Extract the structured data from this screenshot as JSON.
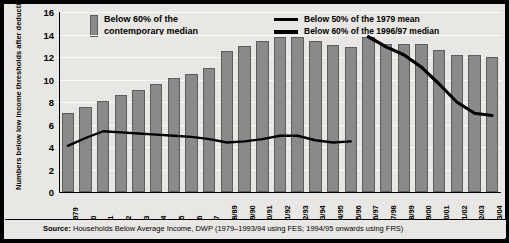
{
  "legend": {
    "bar_label_line1": "Below 60% of the",
    "bar_label_line2": "contemporary median",
    "line1_label": "Below 50% of the 1979 mean",
    "line2_label": "Below 60% of the 1996/97 median",
    "bar_color": "#8a8a8a",
    "line_color": "#000000"
  },
  "axis": {
    "ytitle": "Numbers below low income thresholds after deducting housing costs (millions)"
  },
  "footer": {
    "source_prefix": "Source:",
    "source_text": " Households Below Average Income, DWP (1979–1993/94 using FES; 1994/95 onwards using FRS)"
  },
  "chart_data": {
    "type": "bar",
    "title": "",
    "xlabel": "",
    "ylabel": "Numbers below low income thresholds after deducting housing costs (millions)",
    "ylim": [
      0,
      16
    ],
    "yticks": [
      0,
      2,
      4,
      6,
      8,
      10,
      12,
      14,
      16
    ],
    "grid": true,
    "legend_position": "top",
    "categories": [
      "1979",
      "80",
      "81",
      "82",
      "83",
      "84",
      "85",
      "86",
      "87",
      "88/89",
      "89/90",
      "90/91",
      "91/92",
      "92/93",
      "93/94",
      "94/95",
      "95/96",
      "96/97",
      "97/98",
      "98/99",
      "99/00",
      "00/01",
      "01/02",
      "02/03",
      "03/04"
    ],
    "series": [
      {
        "name": "Below 60% of the contemporary median",
        "type": "bar",
        "values": [
          7.0,
          7.6,
          8.1,
          8.6,
          9.1,
          9.6,
          10.1,
          10.5,
          11.0,
          12.5,
          13.0,
          13.4,
          13.8,
          13.8,
          13.4,
          13.1,
          12.9,
          13.8,
          13.2,
          13.2,
          13.2,
          12.6,
          12.2,
          12.2,
          12.0
        ]
      },
      {
        "name": "Below 50% of the 1979 mean",
        "type": "line",
        "x": [
          "1979",
          "80",
          "81",
          "82",
          "83",
          "84",
          "85",
          "86",
          "87",
          "88/89",
          "89/90",
          "90/91",
          "91/92",
          "92/93",
          "93/94",
          "94/95",
          "95/96"
        ],
        "values": [
          4.1,
          4.8,
          5.4,
          5.3,
          5.2,
          5.1,
          5.0,
          4.9,
          4.7,
          4.4,
          4.5,
          4.7,
          5.0,
          5.0,
          4.6,
          4.4,
          4.5
        ]
      },
      {
        "name": "Below 60% of the 1996/97 median",
        "type": "line",
        "x": [
          "96/97",
          "97/98",
          "98/99",
          "99/00",
          "00/01",
          "01/02",
          "02/03",
          "03/04"
        ],
        "values": [
          13.8,
          12.9,
          12.2,
          11.1,
          9.6,
          8.0,
          7.0,
          6.8
        ]
      }
    ]
  }
}
